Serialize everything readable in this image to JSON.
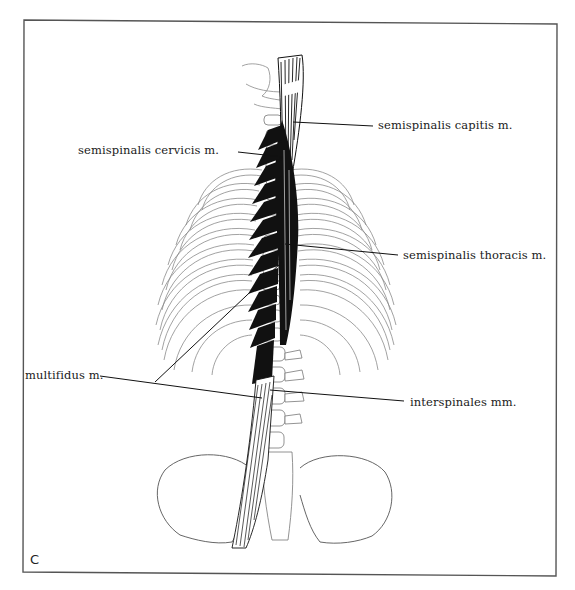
{
  "figure": {
    "panel_letter": "C",
    "labels": [
      {
        "id": "semispinalis-capitis",
        "text": "semispinalis capitis m."
      },
      {
        "id": "semispinalis-cervicis",
        "text": "semispinalis cervicis m."
      },
      {
        "id": "semispinalis-thoracis",
        "text": "semispinalis thoracis m."
      },
      {
        "id": "multifidus",
        "text": "multifidus m."
      },
      {
        "id": "interspinales",
        "text": "interspinales mm."
      }
    ]
  },
  "colors": {
    "frame": "#555555",
    "ink": "#111111",
    "bone_outline": "#777777",
    "background": "#ffffff"
  }
}
